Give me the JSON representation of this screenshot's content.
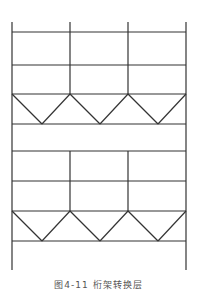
{
  "figure": {
    "caption": "图4-11  桁架转换层",
    "line_color": "#333333",
    "line_width": 1.2
  },
  "structure": {
    "columns_x": [
      12,
      70,
      128,
      186
    ],
    "top_y": 22,
    "bottom_y": 270,
    "floor_beams_y": [
      32,
      65,
      94,
      124,
      151,
      181,
      211,
      241
    ],
    "upper_interior_column_range": [
      22,
      94
    ],
    "middle_interior_column_range": [
      151,
      211
    ],
    "trusses": [
      {
        "name": "upper-truss",
        "top_y": 94,
        "bottom_y": 124,
        "apex_x": [
          42,
          100,
          158
        ]
      },
      {
        "name": "lower-truss",
        "top_y": 211,
        "bottom_y": 241,
        "apex_x": [
          42,
          100,
          158
        ]
      }
    ]
  }
}
